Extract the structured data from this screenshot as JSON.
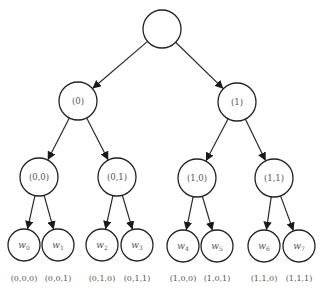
{
  "diagram": {
    "type": "binary-tree",
    "root": {
      "label": "",
      "x": 162,
      "y": 29,
      "r": 19
    },
    "level1": [
      {
        "label": "(0)",
        "x": 78,
        "y": 101,
        "r": 19
      },
      {
        "label": "(1)",
        "x": 237,
        "y": 102,
        "r": 19
      }
    ],
    "level2": [
      {
        "label": "(0,0)",
        "x": 39,
        "y": 177,
        "r": 19
      },
      {
        "label": "(0,1)",
        "x": 117,
        "y": 177,
        "r": 19
      },
      {
        "label": "(1,0)",
        "x": 197,
        "y": 178,
        "r": 19
      },
      {
        "label": "(1,1)",
        "x": 274,
        "y": 178,
        "r": 19
      }
    ],
    "leaves": [
      {
        "var": "w",
        "sub": "0",
        "caption": "(0,0,0)",
        "x": 24,
        "y": 245,
        "r": 16
      },
      {
        "var": "w",
        "sub": "1",
        "caption": "(0,0,1)",
        "x": 58,
        "y": 245,
        "r": 16
      },
      {
        "var": "w",
        "sub": "2",
        "caption": "(0,1,0)",
        "x": 102,
        "y": 245,
        "r": 16
      },
      {
        "var": "w",
        "sub": "3",
        "caption": "(0,1,1)",
        "x": 137,
        "y": 245,
        "r": 16
      },
      {
        "var": "w",
        "sub": "4",
        "caption": "(1,0,0)",
        "x": 183,
        "y": 246,
        "r": 16
      },
      {
        "var": "w",
        "sub": "5",
        "caption": "(1,0,1)",
        "x": 217,
        "y": 246,
        "r": 16
      },
      {
        "var": "w",
        "sub": "6",
        "caption": "(1,1,0)",
        "x": 264,
        "y": 246,
        "r": 16
      },
      {
        "var": "w",
        "sub": "7",
        "caption": "(1,1,1)",
        "x": 299,
        "y": 246,
        "r": 16
      }
    ]
  }
}
